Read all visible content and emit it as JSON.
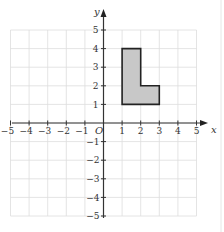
{
  "diagram": {
    "type": "coordinate-grid",
    "x_axis": {
      "label": "x",
      "min": -5,
      "max": 5,
      "ticks": [
        "−5",
        "−4",
        "−3",
        "−2",
        "−1",
        "1",
        "2",
        "3",
        "4",
        "5"
      ]
    },
    "y_axis": {
      "label": "y",
      "min": -5,
      "max": 5,
      "ticks_pos": [
        "1",
        "2",
        "3",
        "4",
        "5"
      ],
      "ticks_neg": [
        "−1",
        "−2",
        "−3",
        "−4",
        "−5"
      ]
    },
    "origin_label": "O",
    "shape": {
      "name": "L-shape",
      "vertices": [
        [
          1,
          1
        ],
        [
          1,
          4
        ],
        [
          2,
          4
        ],
        [
          2,
          2
        ],
        [
          3,
          2
        ],
        [
          3,
          1
        ]
      ],
      "fill": "#c8c8c8",
      "stroke": "#222222"
    },
    "grid_color": "#dddddd",
    "axis_color": "#333333"
  }
}
